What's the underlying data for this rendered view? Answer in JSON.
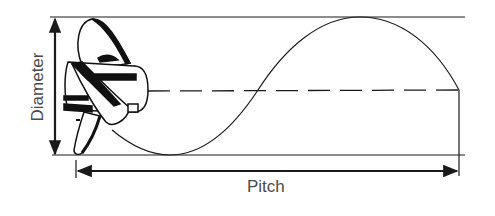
{
  "diagram": {
    "labels": {
      "diameter": "Diameter",
      "pitch": "Pitch"
    },
    "colors": {
      "line": "#1a1a1a",
      "text": "#4a4a4a",
      "background": "#ffffff"
    },
    "elements": [
      "propeller-illustration",
      "diameter-arrow",
      "pitch-arrow",
      "helix-sine-curve",
      "top-boundary-line",
      "center-dashed-line",
      "bottom-boundary-line"
    ]
  }
}
